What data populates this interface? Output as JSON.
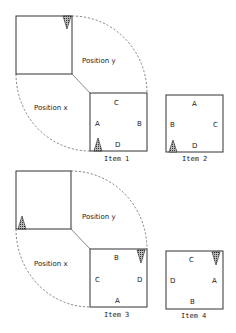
{
  "panels": [
    {
      "id": "top",
      "region_labels": {
        "position_y": "Position y",
        "position_x": "Position x"
      },
      "items": [
        {
          "caption": "Item 1",
          "labels": {
            "top": "C",
            "left": "A",
            "right": "B",
            "bottom": "D"
          },
          "marker": "bottom-left-up"
        },
        {
          "caption": "Item 2",
          "labels": {
            "top": "A",
            "left": "B",
            "right": "C",
            "bottom": "D"
          },
          "marker": "bottom-left-up"
        }
      ],
      "source_marker": "top-right-down"
    },
    {
      "id": "bottom",
      "region_labels": {
        "position_y": "Position y",
        "position_x": "Position x"
      },
      "items": [
        {
          "caption": "Item 3",
          "labels": {
            "top": "B",
            "left": "C",
            "right": "D",
            "bottom": "A"
          },
          "marker": "top-right-down"
        },
        {
          "caption": "Item 4",
          "labels": {
            "top": "C",
            "left": "D",
            "right": "A",
            "bottom": "B"
          },
          "marker": "top-right-down"
        }
      ],
      "source_marker": "bottom-left-up"
    }
  ]
}
